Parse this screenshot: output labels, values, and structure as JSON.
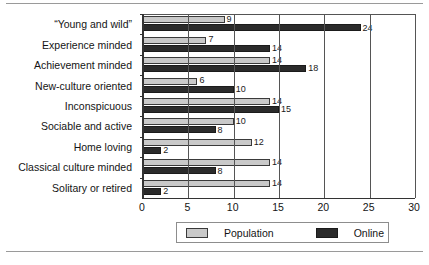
{
  "chart_data": {
    "type": "bar",
    "orientation": "horizontal",
    "title": "",
    "xlabel": "",
    "ylabel": "",
    "xlim": [
      0,
      30
    ],
    "xticks": [
      0,
      5,
      10,
      15,
      20,
      25,
      30
    ],
    "xtick_labels": [
      "0",
      "5",
      "10",
      "15",
      "20",
      "25",
      "30"
    ],
    "grid": true,
    "legend_position": "bottom",
    "categories": [
      "“Young and wild”",
      "Experience minded",
      "Achievement minded",
      "New-culture oriented",
      "Inconspicuous",
      "Sociable and active",
      "Home loving",
      "Classical culture minded",
      "Solitary or retired"
    ],
    "series": [
      {
        "name": "Population",
        "color": "#c9c9c9",
        "values": [
          9,
          7,
          14,
          6,
          14,
          10,
          12,
          14,
          14
        ]
      },
      {
        "name": "Online",
        "color": "#2b2b2b",
        "values": [
          24,
          14,
          18,
          10,
          15,
          8,
          2,
          8,
          2
        ]
      }
    ]
  },
  "legend": {
    "population_label": "Population",
    "online_label": "Online"
  }
}
